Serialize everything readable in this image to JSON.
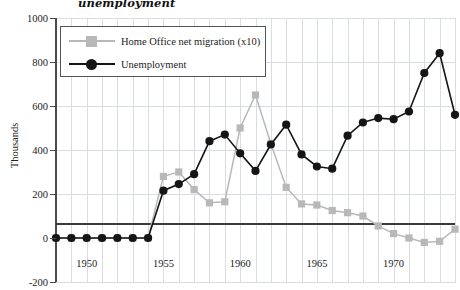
{
  "title": "unemployment",
  "axes": {
    "ylabel": "Thousands",
    "yticks": [
      1000,
      800,
      600,
      400,
      200,
      0,
      -200
    ],
    "xticks": [
      1950,
      1955,
      1960,
      1965,
      1970
    ]
  },
  "legend": {
    "items": [
      {
        "label": "Home Office net migration (x10)",
        "color": "#b8b8b8",
        "marker": "square"
      },
      {
        "label": "Unemployment",
        "color": "#151515",
        "marker": "circle"
      }
    ]
  },
  "chart_data": {
    "type": "line",
    "title": "unemployment",
    "xlabel": "",
    "ylabel": "Thousands",
    "xlim": [
      1948,
      1974
    ],
    "ylim": [
      -200,
      1000
    ],
    "grid": true,
    "legend_position": "top-left",
    "x": [
      1948,
      1949,
      1950,
      1951,
      1952,
      1953,
      1954,
      1955,
      1956,
      1957,
      1958,
      1959,
      1960,
      1961,
      1962,
      1963,
      1964,
      1965,
      1966,
      1967,
      1968,
      1969,
      1970,
      1971,
      1972,
      1973,
      1974
    ],
    "series": [
      {
        "name": "Home Office net migration (x10)",
        "color": "#b8b8b8",
        "marker": "square",
        "values": [
          0,
          0,
          0,
          0,
          0,
          0,
          0,
          280,
          300,
          220,
          160,
          165,
          500,
          650,
          430,
          230,
          155,
          150,
          125,
          115,
          100,
          55,
          20,
          0,
          -20,
          -15,
          40
        ]
      },
      {
        "name": "Unemployment",
        "color": "#151515",
        "marker": "circle",
        "values": [
          0,
          0,
          0,
          0,
          0,
          0,
          0,
          215,
          245,
          290,
          440,
          470,
          385,
          305,
          425,
          515,
          380,
          325,
          315,
          465,
          525,
          545,
          540,
          575,
          750,
          840,
          560
        ]
      }
    ]
  }
}
